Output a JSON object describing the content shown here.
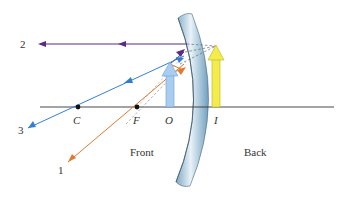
{
  "diagram": {
    "type": "ray diagram",
    "regions": {
      "front": "Front",
      "back": "Back"
    },
    "points": [
      {
        "id": "C",
        "label": "C",
        "x": 78
      },
      {
        "id": "F",
        "label": "F",
        "x": 137
      },
      {
        "id": "O",
        "label": "O",
        "x": 170
      },
      {
        "id": "I",
        "label": "I",
        "x": 216
      }
    ],
    "rays": [
      {
        "id": "1",
        "label": "1",
        "color": "#e07a2e"
      },
      {
        "id": "2",
        "label": "2",
        "color": "#5b2a86"
      },
      {
        "id": "3",
        "label": "3",
        "color": "#2f7fd6"
      }
    ],
    "object_arrow": {
      "color": "#a9cdf0"
    },
    "image_arrow": {
      "color": "#f3ec4a"
    }
  }
}
